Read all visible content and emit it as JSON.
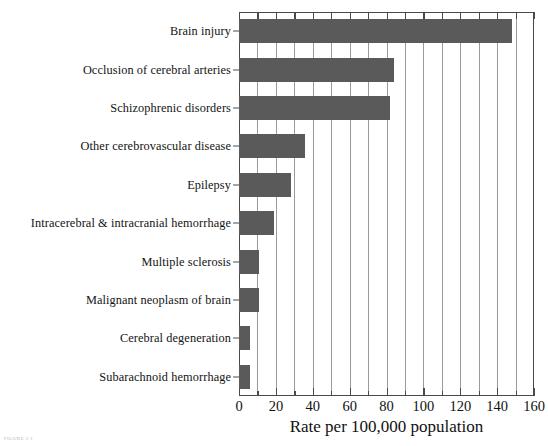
{
  "chart_data": {
    "type": "bar",
    "orientation": "horizontal",
    "title": "",
    "xlabel": "Rate per 100,000 population",
    "ylabel": "",
    "xlim": [
      0,
      160
    ],
    "xticks": [
      0,
      20,
      40,
      60,
      80,
      100,
      120,
      140,
      160
    ],
    "xtick_labels": [
      "0",
      "20",
      "40",
      "60",
      "80",
      "100",
      "120",
      "140",
      "160"
    ],
    "minor_tick_interval": 10,
    "grid": "vertical gridlines every 10 units",
    "legend": "none",
    "bar_color": "#5a5a5a",
    "categories": [
      "Brain injury",
      "Occlusion of cerebral arteries",
      "Schizophrenic disorders",
      "Other cerebrovascular disease",
      "Epilepsy",
      "Intracerebral & intracranial hemorrhage",
      "Multiple sclerosis",
      "Malignant neoplasm of brain",
      "Cerebral degeneration",
      "Subarachnoid hemorrhage"
    ],
    "values": [
      148,
      84,
      82,
      36,
      28,
      19,
      11,
      11,
      6,
      6
    ]
  },
  "caption": {
    "text": "FIGURE 2-1"
  }
}
